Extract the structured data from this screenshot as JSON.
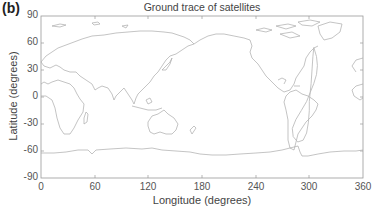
{
  "panel_label": "(b)",
  "chart_data": {
    "type": "line",
    "title": "Ground trace of satellites",
    "xlabel": "Longitude (degrees)",
    "ylabel": "Latitude (degrees)",
    "xlim": [
      0,
      360
    ],
    "ylim": [
      -90,
      90
    ],
    "xticks": [
      0,
      60,
      120,
      180,
      240,
      300,
      360
    ],
    "yticks": [
      90,
      60,
      30,
      0,
      -30,
      -60,
      -90
    ],
    "grid": false,
    "legend": null,
    "background_layer": "world coastlines (0-360 longitude)",
    "series": [
      {
        "name": "satellite ground trace",
        "style": "thin gray line, figure-8 loop",
        "points": [
          [
            305,
            55
          ],
          [
            308,
            45
          ],
          [
            309,
            35
          ],
          [
            308,
            25
          ],
          [
            305,
            15
          ],
          [
            301,
            5
          ],
          [
            297,
            -5
          ],
          [
            291,
            -15
          ],
          [
            285,
            -25
          ],
          [
            281,
            -35
          ],
          [
            282,
            -44
          ],
          [
            287,
            -50
          ],
          [
            293,
            -48
          ],
          [
            297,
            -40
          ],
          [
            299,
            -28
          ],
          [
            300,
            -15
          ],
          [
            300,
            -5
          ],
          [
            301,
            5
          ],
          [
            302,
            15
          ],
          [
            303,
            30
          ],
          [
            304,
            45
          ],
          [
            305,
            55
          ]
        ]
      }
    ]
  }
}
